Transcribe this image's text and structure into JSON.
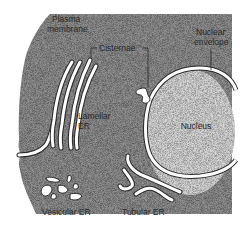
{
  "diagram": {
    "type": "cell-biology-illustration"
  },
  "labels": {
    "plasma_membrane_line1": "Plasma",
    "plasma_membrane_line2": "membrane",
    "cisternae": "Cisternae",
    "nuclear_envelope_line1": "Nuclear",
    "nuclear_envelope_line2": "envelope",
    "lamellar_er_line1": "Lamellar",
    "lamellar_er_line2": "ER",
    "nucleus": "Nucleus",
    "vesicular_er": "Vesicular ER",
    "tubular_er": "Tubular ER"
  },
  "colors": {
    "cytoplasm": "#8f8f8f",
    "nucleoplasm": "#d6d6d6",
    "membrane": "#ffffff",
    "outline": "#2a2a2a",
    "background": "#ffffff"
  }
}
